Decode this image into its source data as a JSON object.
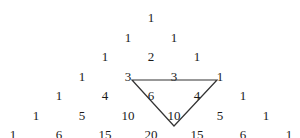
{
  "diagram": {
    "title": "",
    "rows": [
      [
        "1"
      ],
      [
        "1",
        "1"
      ],
      [
        "1",
        "2",
        "1"
      ],
      [
        "1",
        "3",
        "3",
        "1"
      ],
      [
        "1",
        "4",
        "6",
        "4",
        "1"
      ],
      [
        "1",
        "5",
        "10",
        "10",
        "5",
        "1"
      ],
      [
        "1",
        "6",
        "15",
        "20",
        "15",
        "6",
        "1"
      ]
    ],
    "highlight_triangle": {
      "points": [
        [
          132,
          80
        ],
        [
          217,
          80
        ],
        [
          174,
          126
        ]
      ],
      "stroke": "#333333",
      "contains": [
        "6",
        "4",
        "10"
      ],
      "sum_target": "20"
    }
  }
}
